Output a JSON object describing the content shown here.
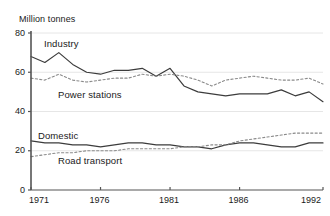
{
  "chart_data": {
    "type": "line",
    "title": "Million tonnes",
    "subtitle": "",
    "xlabel": "",
    "ylabel": "Million tonnes",
    "grid": true,
    "legend_position": "inline-labels",
    "xlim": [
      1971,
      1992
    ],
    "ylim": [
      0,
      80
    ],
    "yticks": [
      0,
      20,
      40,
      60,
      80
    ],
    "ytick_labels": [
      "0",
      "20",
      "40",
      "60",
      "80"
    ],
    "xticks": [
      1971,
      1976,
      1981,
      1986,
      1992
    ],
    "xtick_labels": [
      "1971",
      "1976",
      "1981",
      "1986",
      "1992"
    ],
    "x": [
      1971,
      1972,
      1973,
      1974,
      1975,
      1976,
      1977,
      1978,
      1979,
      1980,
      1981,
      1982,
      1983,
      1984,
      1985,
      1986,
      1987,
      1988,
      1989,
      1990,
      1991,
      1992
    ],
    "series": [
      {
        "name": "Industry",
        "style": "solid",
        "color": "#3c3c3c",
        "values": [
          68,
          65,
          70,
          64,
          60,
          59,
          61,
          61,
          62,
          58,
          62,
          53,
          50,
          49,
          48,
          49,
          49,
          49,
          51,
          48,
          50,
          45
        ]
      },
      {
        "name": "Power stations",
        "style": "dashed",
        "color": "#8a8a8a",
        "values": [
          57,
          56,
          59,
          56,
          55,
          56,
          57,
          57,
          59,
          58,
          59,
          58,
          56,
          53,
          56,
          57,
          58,
          57,
          56,
          56,
          57,
          54
        ]
      },
      {
        "name": "Domestic",
        "style": "solid",
        "color": "#3c3c3c",
        "values": [
          25,
          24,
          24,
          23,
          23,
          22,
          23,
          24,
          24,
          23,
          23,
          22,
          22,
          21,
          23,
          24,
          24,
          23,
          22,
          22,
          24,
          24
        ]
      },
      {
        "name": "Road transport",
        "style": "dashed",
        "color": "#8a8a8a",
        "values": [
          17,
          18,
          19,
          19,
          20,
          20,
          20,
          21,
          21,
          21,
          21,
          22,
          22,
          23,
          23,
          25,
          26,
          27,
          28,
          29,
          29,
          29
        ]
      }
    ]
  },
  "labels": {
    "axis_title": "Million tonnes",
    "industry": "Industry",
    "power_stations": "Power stations",
    "domestic": "Domestic",
    "road_transport": "Road transport"
  },
  "colors": {
    "solid_line": "#3c3c3c",
    "dashed_line": "#8a8a8a",
    "axis": "#555555",
    "grid": "#e6e6e6",
    "background": "#ffffff",
    "text": "#1a1a1a"
  }
}
